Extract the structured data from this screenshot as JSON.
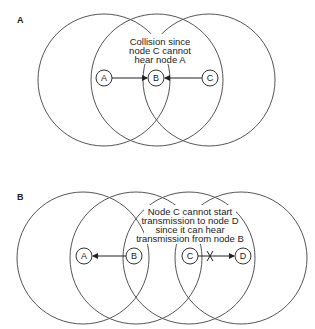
{
  "panels": [
    {
      "label": "A",
      "note_lines": [
        "Collision since",
        "node C cannot",
        "hear node A"
      ],
      "nodes": [
        {
          "label": "A",
          "cx": 104,
          "cy": 78
        },
        {
          "label": "B",
          "cx": 156,
          "cy": 78
        },
        {
          "label": "C",
          "cx": 210,
          "cy": 78
        }
      ],
      "range_circles": [
        {
          "cx": 104,
          "cy": 80,
          "r": 66
        },
        {
          "cx": 157,
          "cy": 80,
          "r": 66
        },
        {
          "cx": 209,
          "cy": 80,
          "r": 66
        }
      ],
      "arrows": [
        {
          "from": "A",
          "to": "B",
          "blocked": false
        },
        {
          "from": "C",
          "to": "B",
          "blocked": false
        }
      ]
    },
    {
      "label": "B",
      "note_lines": [
        "Node C cannot start",
        "transmission to node D",
        "since it can hear",
        "transmission from node B"
      ],
      "nodes": [
        {
          "label": "A",
          "cx": 84,
          "cy": 256
        },
        {
          "label": "B",
          "cx": 134,
          "cy": 256
        },
        {
          "label": "C",
          "cx": 190,
          "cy": 256
        },
        {
          "label": "D",
          "cx": 243,
          "cy": 256
        }
      ],
      "range_circles": [
        {
          "cx": 83,
          "cy": 258,
          "r": 66
        },
        {
          "cx": 136,
          "cy": 258,
          "r": 66
        },
        {
          "cx": 189,
          "cy": 258,
          "r": 66
        },
        {
          "cx": 241,
          "cy": 258,
          "r": 66
        }
      ],
      "arrows": [
        {
          "from": "B",
          "to": "A",
          "blocked": false
        },
        {
          "from": "C",
          "to": "D",
          "blocked": true
        }
      ]
    }
  ]
}
